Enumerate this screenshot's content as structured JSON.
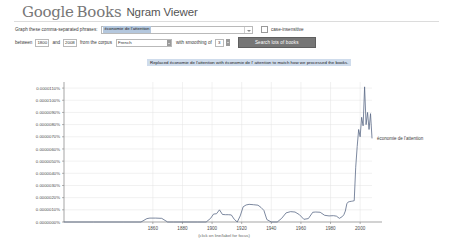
{
  "header": {
    "logo_google": "Google",
    "logo_books": "Books",
    "product": "Ngram Viewer"
  },
  "query_form": {
    "phrase_label": "Graph these comma-separated phrases:",
    "phrase_value": "économie de l'attention",
    "case_insensitive_label": "case-insensitive",
    "case_insensitive_checked": false,
    "between_label": "between",
    "year_start": "1800",
    "and_label": "and",
    "year_end": "2008",
    "corpus_label": "from the corpus",
    "corpus_value": "French",
    "smoothing_label": "with smoothing of",
    "smoothing_value": "3",
    "search_button_label": "Search lots of books"
  },
  "notice": {
    "text": "Replaced économie de l'attention with économie de l' attention to match how we processed the books."
  },
  "chart_data": {
    "type": "line",
    "title": "",
    "xlabel": "(click on line/label for focus)",
    "ylabel": "",
    "grid": true,
    "legend_position": "right-inline",
    "xlim": [
      1800,
      2008
    ],
    "ylim": [
      0.0,
      1.15e-05
    ],
    "xticks": [
      "1860",
      "1880",
      "1900",
      "1920",
      "1940",
      "1960",
      "1980",
      "2000"
    ],
    "xtick_values": [
      1860,
      1880,
      1900,
      1920,
      1940,
      1960,
      1980,
      2000
    ],
    "yticks": [
      "0.0000110%",
      "0.0000100%",
      "0.0000090%",
      "0.0000080%",
      "0.0000070%",
      "0.0000060%",
      "0.0000050%",
      "0.0000040%",
      "0.0000030%",
      "0.0000020%",
      "0.0000010%",
      "0.0000000%"
    ],
    "ytick_values": [
      1.1e-05,
      1e-05,
      9e-06,
      8e-06,
      7e-06,
      6e-06,
      5e-06,
      4e-06,
      3e-06,
      2e-06,
      1e-06,
      0.0
    ],
    "series": [
      {
        "name": "économie de l'attention",
        "color": "#5a6a86",
        "x": [
          1800,
          1820,
          1840,
          1852,
          1856,
          1858,
          1862,
          1866,
          1870,
          1874,
          1880,
          1890,
          1896,
          1899,
          1901,
          1903,
          1905,
          1907,
          1909,
          1911,
          1913,
          1915,
          1917,
          1919,
          1921,
          1923,
          1925,
          1928,
          1931,
          1933,
          1935,
          1937,
          1940,
          1944,
          1947,
          1950,
          1953,
          1956,
          1959,
          1962,
          1965,
          1968,
          1970,
          1973,
          1976,
          1979,
          1982,
          1984,
          1986,
          1988,
          1989,
          1990,
          1991,
          1992,
          1993,
          1994,
          1995,
          1996,
          1997,
          1998,
          1999,
          2000,
          2001,
          2002,
          2003,
          2004,
          2005,
          2006,
          2007,
          2008
        ],
        "y": [
          0.0,
          0.0,
          0.0,
          0.0,
          2.8e-07,
          3.2e-07,
          3.2e-07,
          3e-07,
          0.0,
          0.0,
          0.0,
          0.0,
          0.0,
          3e-07,
          6.5e-07,
          6.8e-07,
          1e-06,
          6.2e-07,
          6e-07,
          6e-07,
          5.8e-07,
          2.2e-07,
          0.0,
          5e-07,
          1.25e-06,
          1.4e-06,
          1.45e-06,
          1.42e-06,
          1.38e-06,
          1.2e-06,
          9.5e-07,
          2e-07,
          0.0,
          0.0,
          3e-07,
          7.5e-07,
          8.5e-07,
          8.2e-07,
          6e-07,
          2.2e-07,
          2.8e-07,
          8e-07,
          8.2e-07,
          8e-07,
          5.5e-07,
          5e-07,
          5.2e-07,
          4.8e-07,
          3e-07,
          4.5e-07,
          6e-07,
          9e-07,
          1.5e-06,
          1.65e-06,
          1.68e-06,
          1.7e-06,
          1.72e-06,
          1.75e-06,
          4.5e-06,
          6.2e-06,
          7.6e-06,
          7e-06,
          8.6e-06,
          7.9e-06,
          1.11e-05,
          8e-06,
          9e-06,
          7.6e-06,
          8.9e-06,
          6.9e-06
        ]
      }
    ]
  }
}
